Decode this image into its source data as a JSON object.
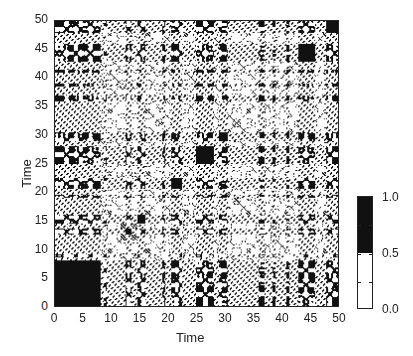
{
  "chart_data": {
    "type": "heatmap",
    "subtype": "recurrence-plot",
    "title": "",
    "xlabel": "Time",
    "ylabel": "Time",
    "xlim": [
      0,
      50
    ],
    "ylim": [
      0,
      50
    ],
    "xticks": [
      "0",
      "5",
      "10",
      "15",
      "20",
      "25",
      "30",
      "35",
      "40",
      "45",
      "50"
    ],
    "yticks": [
      "0",
      "5",
      "10",
      "15",
      "20",
      "25",
      "30",
      "35",
      "40",
      "45",
      "50"
    ],
    "symmetric": true,
    "grid": false,
    "black_regime_intervals": [
      [
        0,
        8
      ],
      [
        8.5,
        9
      ],
      [
        12.5,
        13.5
      ],
      [
        14.5,
        16
      ],
      [
        19,
        19.5
      ],
      [
        20.5,
        22.5
      ],
      [
        25,
        28
      ],
      [
        29,
        30.5
      ],
      [
        36,
        37
      ],
      [
        38.5,
        39
      ],
      [
        41,
        41.5
      ],
      [
        43,
        46
      ],
      [
        48,
        50
      ]
    ],
    "colorbar": {
      "ticks": [
        "0.0",
        "0.5",
        "1.0"
      ],
      "levels": [
        {
          "range": [
            0.0,
            0.5
          ],
          "color": "#ffffff"
        },
        {
          "range": [
            0.5,
            1.0
          ],
          "color": "#111111"
        }
      ],
      "position": "right"
    }
  },
  "colors": {
    "ink": "#111111",
    "background": "#ffffff"
  }
}
